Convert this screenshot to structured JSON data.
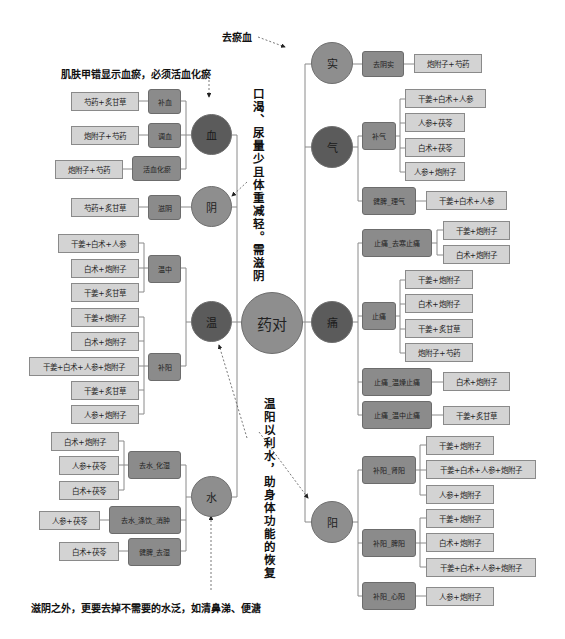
{
  "center": {
    "label": "药对"
  },
  "annotations": {
    "remove_stasis": "去瘀血",
    "skin_nail": "肌肤甲错显示血瘀，必须活血化瘀",
    "thirst": "口渴、尿量少且体重减轻。需滋阴",
    "warm_yang": "温阳以利水，助身体功能的恢复",
    "bottom": "滋阴之外，更要去掉不需要的水泛，如清鼻涕、便溏"
  },
  "left": {
    "blood": {
      "label": "血",
      "categories": [
        {
          "label": "补血",
          "leaves": [
            "芍药+炙甘草"
          ]
        },
        {
          "label": "调血",
          "leaves": [
            "炮附子+芍药"
          ]
        },
        {
          "label": "活血化瘀",
          "leaves": [
            "炮附子+芍药"
          ]
        }
      ]
    },
    "yin": {
      "label": "阴",
      "categories": [
        {
          "label": "滋阴",
          "leaves": [
            "芍药+炙甘草"
          ]
        }
      ]
    },
    "warm": {
      "label": "温",
      "categories": [
        {
          "label": "温中",
          "leaves": [
            "干姜+白术+人参",
            "白术+炮附子",
            "干姜+炙甘草"
          ]
        },
        {
          "label": "补阳",
          "leaves": [
            "干姜+炮附子",
            "白术+炮附子",
            "干姜+白术+人参+炮附子",
            "干姜+炙甘草",
            "人参+炮附子"
          ]
        }
      ]
    },
    "water": {
      "label": "水",
      "categories": [
        {
          "label": "去水_化湿",
          "leaves": [
            "白术+炮附子",
            "人参+茯苓",
            "白术+茯苓"
          ]
        },
        {
          "label": "去水_涤饮_消肿",
          "leaves": [
            "人参+茯苓"
          ]
        },
        {
          "label": "健脾_去湿",
          "leaves": [
            "白术+茯苓"
          ]
        }
      ]
    }
  },
  "right": {
    "excess": {
      "label": "实",
      "categories": [
        {
          "label": "去阴实",
          "leaves": [
            "炮附子+芍药"
          ]
        }
      ]
    },
    "qi": {
      "label": "气",
      "categories": [
        {
          "label": "补气",
          "leaves": [
            "干姜+白术+人参",
            "人参+茯苓",
            "白术+茯苓",
            "人参+炮附子"
          ]
        },
        {
          "label": "健脾_理气",
          "leaves": [
            "干姜+白术+人参"
          ]
        }
      ]
    },
    "pain": {
      "label": "痛",
      "categories": [
        {
          "label": "止痛_去寒止痛",
          "leaves": [
            "干姜+炮附子",
            "白术+炮附子"
          ]
        },
        {
          "label": "止痛",
          "leaves": [
            "干姜+炮附子",
            "白术+炮附子",
            "干姜+炙甘草",
            "炮附子+芍药"
          ]
        },
        {
          "label": "止痛_温燥止痛",
          "leaves": [
            "白术+炮附子"
          ]
        },
        {
          "label": "止痛_温中止痛",
          "leaves": [
            "干姜+炙甘草"
          ]
        }
      ]
    },
    "yang": {
      "label": "阳",
      "categories": [
        {
          "label": "补阳_肾阳",
          "leaves": [
            "干姜+炮附子",
            "干姜+白术+人参+炮附子",
            "人参+炮附子"
          ]
        },
        {
          "label": "补阳_脾阳",
          "leaves": [
            "干姜+炮附子",
            "白术+炮附子",
            "干姜+白术+人参+炮附子"
          ]
        },
        {
          "label": "补阳_心阳",
          "leaves": [
            "人参+炮附子"
          ]
        }
      ]
    }
  },
  "colors": {
    "dark_node": "#5b5b5b",
    "mid_node": "#8e8e8e",
    "category_box": "#8b8b8b",
    "leaf_box": "#d3d3d3",
    "line": "#8a8a8a"
  }
}
